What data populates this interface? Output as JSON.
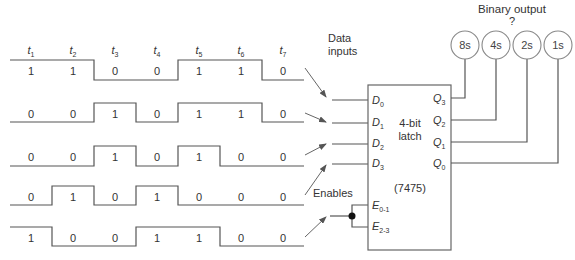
{
  "title": {
    "binary_output": "Binary output",
    "question_mark": "?",
    "data_inputs_line1": "Data",
    "data_inputs_line2": "inputs",
    "enables": "Enables"
  },
  "time_labels": [
    {
      "t": "t",
      "sub": "1"
    },
    {
      "t": "t",
      "sub": "2"
    },
    {
      "t": "t",
      "sub": "3"
    },
    {
      "t": "t",
      "sub": "4"
    },
    {
      "t": "t",
      "sub": "5"
    },
    {
      "t": "t",
      "sub": "6"
    },
    {
      "t": "t",
      "sub": "7"
    }
  ],
  "waveforms": [
    {
      "name": "D0",
      "bits": [
        "1",
        "1",
        "0",
        "0",
        "1",
        "1",
        "0"
      ]
    },
    {
      "name": "D1",
      "bits": [
        "0",
        "0",
        "1",
        "0",
        "1",
        "1",
        "0"
      ]
    },
    {
      "name": "D2",
      "bits": [
        "0",
        "0",
        "1",
        "0",
        "1",
        "0",
        "0"
      ]
    },
    {
      "name": "D3",
      "bits": [
        "0",
        "1",
        "0",
        "1",
        "0",
        "0",
        "0"
      ]
    },
    {
      "name": "Enable",
      "bits": [
        "1",
        "0",
        "0",
        "1",
        "1",
        "0",
        "0"
      ]
    }
  ],
  "latch": {
    "line1": "4-bit",
    "line2": "latch",
    "part": "(7475)",
    "inputs": [
      {
        "l": "D",
        "sub": "0"
      },
      {
        "l": "D",
        "sub": "1"
      },
      {
        "l": "D",
        "sub": "2"
      },
      {
        "l": "D",
        "sub": "3"
      }
    ],
    "enables": [
      {
        "l": "E",
        "sub": "0-1"
      },
      {
        "l": "E",
        "sub": "2-3"
      }
    ],
    "outputs": [
      {
        "l": "Q",
        "sub": "3"
      },
      {
        "l": "Q",
        "sub": "2"
      },
      {
        "l": "Q",
        "sub": "1"
      },
      {
        "l": "Q",
        "sub": "0"
      }
    ]
  },
  "output_indicators": [
    "8s",
    "4s",
    "2s",
    "1s"
  ],
  "colors": {
    "line": "#555555",
    "text": "#333333",
    "circle": "#888888"
  }
}
